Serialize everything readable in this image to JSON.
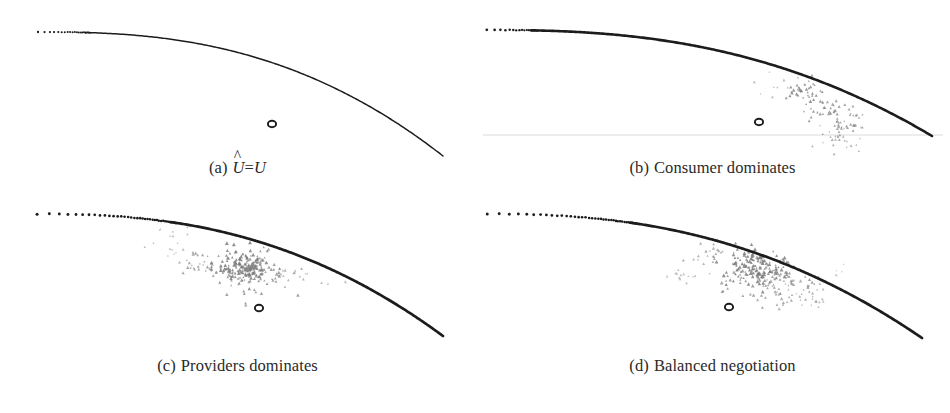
{
  "figure": {
    "background_color": "#ffffff",
    "curve_color": "#1c1c1c",
    "scatter_color": "#7d7d7d",
    "marker_color": "#1c1c1c",
    "axis_color": "#d8d8d8"
  },
  "panels": [
    {
      "id": "a",
      "label": "(a)",
      "caption_plain": "Û=U",
      "caption_parts": {
        "hatted": "U",
        "hat": "^",
        "equals": "=",
        "rhs": "U"
      },
      "has_scatter": false,
      "has_axis_line": false
    },
    {
      "id": "b",
      "label": "(b)",
      "caption_plain": "Consumer dominates",
      "has_scatter": true,
      "has_axis_line": true
    },
    {
      "id": "c",
      "label": "(c)",
      "caption_plain": "Providers dominates",
      "has_scatter": true,
      "has_axis_line": false
    },
    {
      "id": "d",
      "label": "(d)",
      "caption_plain": "Balanced negotiation",
      "has_scatter": true,
      "has_axis_line": false
    }
  ],
  "chart_data": {
    "type": "scatter",
    "title": "",
    "xlabel": "",
    "ylabel": "",
    "xlim": [
      0,
      1
    ],
    "ylim": [
      0,
      1
    ],
    "grid": false,
    "legend": "none",
    "panels": [
      {
        "id": "a",
        "caption": "Û=U",
        "frontier": {
          "marker": "dot-to-solid",
          "x_start": 0.08,
          "x_end": 0.95,
          "y_start": 0.84,
          "y_end": 0.1,
          "shape": "concave-quarter-ellipse"
        },
        "reference_point": {
          "x": 0.575,
          "y": 0.27,
          "marker": "open-circle"
        },
        "outcomes": {
          "count": 0,
          "points": []
        }
      },
      {
        "id": "b",
        "caption": "Consumer dominates",
        "frontier": {
          "marker": "dot-to-solid",
          "x_start": 0.03,
          "x_end": 0.96,
          "y_start": 0.87,
          "y_end": 0.16,
          "shape": "concave-quarter-ellipse"
        },
        "reference_point": {
          "x": 0.54,
          "y": 0.27,
          "marker": "open-circle"
        },
        "axis_line_y": 0.165,
        "outcomes": {
          "count": 120,
          "marker": "triangle",
          "color": "#7d7d7d",
          "cluster_center": {
            "x": 0.83,
            "y": 0.38
          },
          "cluster_spread": {
            "x": 0.09,
            "y": 0.14
          },
          "note": "Outcomes hug the lower-right of the frontier, favouring the consumer axis."
        }
      },
      {
        "id": "c",
        "caption": "Providers dominates",
        "frontier": {
          "marker": "dot-to-solid",
          "x_start": 0.06,
          "x_end": 0.95,
          "y_start": 0.9,
          "y_end": 0.07,
          "shape": "concave-quarter-ellipse"
        },
        "reference_point": {
          "x": 0.545,
          "y": 0.24,
          "marker": "open-circle"
        },
        "outcomes": {
          "count": 260,
          "marker": "triangle",
          "color": "#7d7d7d",
          "cluster_center": {
            "x": 0.5,
            "y": 0.55
          },
          "cluster_spread": {
            "x": 0.09,
            "y": 0.07
          },
          "satellite_cluster": {
            "x": 0.36,
            "y": 0.74,
            "count": 14
          },
          "note": "Dense round cluster sits well inside the frontier, shifted toward the provider axis."
        }
      },
      {
        "id": "d",
        "caption": "Balanced negotiation",
        "frontier": {
          "marker": "dot-to-solid",
          "x_start": 0.04,
          "x_end": 0.94,
          "y_start": 0.9,
          "y_end": 0.07,
          "shape": "concave-quarter-ellipse"
        },
        "reference_point": {
          "x": 0.535,
          "y": 0.23,
          "marker": "open-circle"
        },
        "outcomes": {
          "count": 300,
          "marker": "triangle",
          "color": "#7d7d7d",
          "cluster_center": {
            "x": 0.585,
            "y": 0.57
          },
          "cluster_spread": {
            "x": 0.12,
            "y": 0.08
          },
          "orientation": "elongated-diagonal",
          "satellite_cluster": {
            "x": 0.41,
            "y": 0.68,
            "count": 18
          },
          "note": "Outcome cloud stretches diagonally along the frontier, balanced between both parties."
        }
      }
    ]
  }
}
